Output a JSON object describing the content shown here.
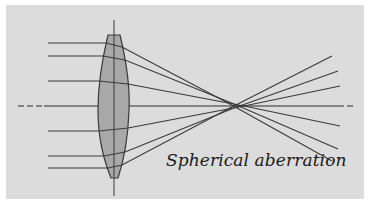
{
  "figure": {
    "caption": "Spherical aberration",
    "colors": {
      "background": "#ffffff",
      "panel": "#dcdcdc",
      "lens_fill": "#a8a8a8",
      "lens_stroke": "#3a3a3a",
      "ray": "#3a3a3a",
      "axis": "#2a2a2a"
    },
    "optical_axis": {
      "y": 106,
      "x_start": 18,
      "x_end": 352,
      "dashed_ends": true
    },
    "lens": {
      "type": "biconvex",
      "center_x": 114,
      "top_y": 35,
      "bottom_y": 178,
      "left_x": 98,
      "right_x": 129,
      "vertical_axis": {
        "x": 114,
        "y_start": 20,
        "y_end": 196
      }
    },
    "rays": [
      {
        "y_in": 43,
        "x_start": 48
      },
      {
        "y_in": 56,
        "x_start": 48
      },
      {
        "y_in": 81,
        "x_start": 48
      },
      {
        "y_in": 131,
        "x_start": 48
      },
      {
        "y_in": 156,
        "x_start": 48
      },
      {
        "y_in": 168,
        "x_start": 48
      }
    ],
    "focus_region": {
      "x": 238,
      "y": 106
    }
  }
}
